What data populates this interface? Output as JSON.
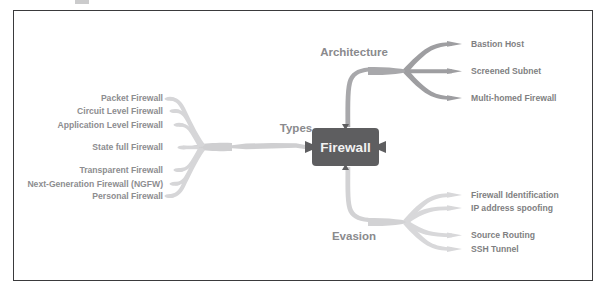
{
  "diagram": {
    "type": "mind-map",
    "title_node": "Firewall",
    "colors": {
      "central_node_fill": "#5e5e60",
      "central_node_text": "#f2f2f2",
      "branch_types": "#cfcfd1",
      "branch_architecture": "#a8a8ab",
      "branch_evasion": "#d2d2d4",
      "label_text": "#8a8a8d",
      "frame_border": "#3a3a3c",
      "background": "#ffffff"
    },
    "branches": [
      {
        "id": "types",
        "label": "Types",
        "direction": "left",
        "children": [
          {
            "label": "Packet Firewall"
          },
          {
            "label": "Circuit Level Firewall"
          },
          {
            "label": "Application Level Firewall"
          },
          {
            "label": "State full Firewall"
          },
          {
            "label": "Transparent Firewall"
          },
          {
            "label": "Next-Generation Firewall (NGFW)"
          },
          {
            "label": "Personal Firewall"
          }
        ]
      },
      {
        "id": "architecture",
        "label": "Architecture",
        "direction": "up-right",
        "children": [
          {
            "label": "Bastion Host"
          },
          {
            "label": "Screened Subnet"
          },
          {
            "label": "Multi-homed Firewall"
          }
        ]
      },
      {
        "id": "evasion",
        "label": "Evasion",
        "direction": "down-right",
        "children": [
          {
            "label": "Firewall Identification"
          },
          {
            "label": "IP address spoofing"
          },
          {
            "label": "Source Routing"
          },
          {
            "label": "SSH Tunnel"
          }
        ]
      }
    ]
  }
}
